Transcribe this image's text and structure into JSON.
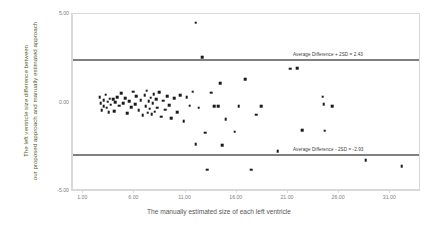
{
  "chart_data": {
    "type": "scatter",
    "title": "",
    "xlabel": "The manually estimated size of each left ventricle",
    "ylabel_line1": "The left ventricle size difference between",
    "ylabel_line2": "our proposed approach and manually estimated approach",
    "xlim": [
      0.0,
      34.0
    ],
    "ylim": [
      -5.0,
      5.0
    ],
    "xticks": [
      "1.00",
      "6.00",
      "11.00",
      "16.00",
      "21.00",
      "26.00",
      "31.00"
    ],
    "xtick_values": [
      1.0,
      6.0,
      11.0,
      16.0,
      21.0,
      26.0,
      31.0
    ],
    "yticks": [
      "5.00",
      "0.00",
      "-5.00"
    ],
    "ytick_values": [
      5.0,
      0.0,
      -5.0
    ],
    "grid": false,
    "legend": "none",
    "marker_color": "#1a1a1a",
    "line_color": "#808080",
    "annotations": [
      {
        "name": "upper-limit",
        "label": "Average Difference + 2SD = 2.43",
        "value": 2.43
      },
      {
        "name": "lower-limit",
        "label": "Average Difference - 2SD = -2.93",
        "value": -2.93
      }
    ],
    "points": [
      [
        2.6,
        0.3
      ],
      [
        2.7,
        -0.05
      ],
      [
        2.8,
        -0.42
      ],
      [
        3.0,
        0.12
      ],
      [
        3.0,
        -0.22
      ],
      [
        3.2,
        0.45
      ],
      [
        3.3,
        -0.3
      ],
      [
        3.4,
        0.05
      ],
      [
        3.5,
        -0.55
      ],
      [
        3.6,
        0.22
      ],
      [
        3.7,
        -0.12
      ],
      [
        3.9,
        0.18
      ],
      [
        4.0,
        -0.48
      ],
      [
        4.1,
        0.02
      ],
      [
        4.3,
        0.3
      ],
      [
        4.5,
        -0.18
      ],
      [
        4.7,
        0.52
      ],
      [
        4.9,
        -0.05
      ],
      [
        5.1,
        0.25
      ],
      [
        5.3,
        -0.62
      ],
      [
        5.5,
        0.08
      ],
      [
        5.7,
        -0.28
      ],
      [
        5.9,
        0.62
      ],
      [
        6.1,
        -0.1
      ],
      [
        6.2,
        0.34
      ],
      [
        6.4,
        -0.45
      ],
      [
        6.6,
        0.14
      ],
      [
        6.8,
        -0.72
      ],
      [
        7.0,
        0.4
      ],
      [
        7.1,
        -0.2
      ],
      [
        7.2,
        0.66
      ],
      [
        7.3,
        -0.58
      ],
      [
        7.4,
        0.06
      ],
      [
        7.5,
        -0.36
      ],
      [
        7.6,
        0.28
      ],
      [
        7.7,
        -0.66
      ],
      [
        7.8,
        -0.05
      ],
      [
        7.9,
        0.46
      ],
      [
        8.0,
        -0.52
      ],
      [
        8.1,
        0.18
      ],
      [
        8.2,
        -0.3
      ],
      [
        8.4,
        0.58
      ],
      [
        8.6,
        -0.8
      ],
      [
        8.8,
        0.1
      ],
      [
        9.0,
        -0.4
      ],
      [
        9.2,
        0.36
      ],
      [
        9.4,
        -0.14
      ],
      [
        9.6,
        -0.88
      ],
      [
        9.9,
        0.24
      ],
      [
        10.2,
        -0.55
      ],
      [
        10.5,
        0.42
      ],
      [
        10.8,
        -1.05
      ],
      [
        11.1,
        0.3
      ],
      [
        11.4,
        -0.18
      ],
      [
        11.7,
        0.62
      ],
      [
        12.0,
        4.5
      ],
      [
        12.0,
        -2.35
      ],
      [
        12.3,
        -0.3
      ],
      [
        12.6,
        2.55
      ],
      [
        12.9,
        -1.7
      ],
      [
        13.1,
        -3.8
      ],
      [
        13.5,
        0.55
      ],
      [
        13.8,
        -0.22
      ],
      [
        14.2,
        -0.2
      ],
      [
        14.4,
        1.1
      ],
      [
        14.6,
        -2.4
      ],
      [
        14.9,
        -0.95
      ],
      [
        15.8,
        -1.65
      ],
      [
        16.2,
        -0.22
      ],
      [
        16.8,
        1.3
      ],
      [
        17.4,
        -3.8
      ],
      [
        17.9,
        -0.7
      ],
      [
        18.4,
        -0.22
      ],
      [
        20.0,
        -2.75
      ],
      [
        21.2,
        1.9
      ],
      [
        21.9,
        1.95
      ],
      [
        22.4,
        -1.55
      ],
      [
        24.4,
        0.32
      ],
      [
        24.5,
        -0.08
      ],
      [
        24.6,
        -1.6
      ],
      [
        25.3,
        -0.2
      ],
      [
        28.6,
        -3.25
      ],
      [
        32.1,
        -3.6
      ]
    ]
  }
}
